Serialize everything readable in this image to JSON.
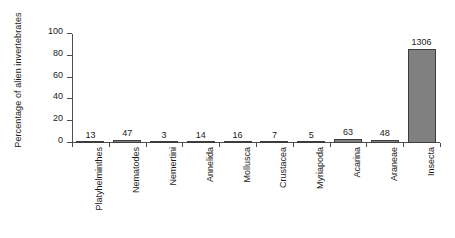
{
  "chart_data": {
    "type": "bar",
    "title": "",
    "xlabel": "",
    "ylabel": "Percentage of alien invertebrates",
    "ylim": [
      0,
      100
    ],
    "yticks": [
      0,
      20,
      40,
      60,
      80,
      100
    ],
    "grid": false,
    "legend": false,
    "categories": [
      "Platyhelminthes",
      "Nematodes",
      "Nemertini",
      "Annelida",
      "Mollusca",
      "Crustacea",
      "Myriapoda",
      "Acarina",
      "Araneae",
      "Insecta"
    ],
    "data_labels": [
      "13",
      "47",
      "3",
      "14",
      "16",
      "7",
      "5",
      "63",
      "48",
      "1306"
    ],
    "counts": [
      13,
      47,
      3,
      14,
      16,
      7,
      5,
      63,
      48,
      1306
    ],
    "values": [
      0.9,
      3.1,
      0.2,
      0.9,
      1.1,
      0.5,
      0.3,
      4.1,
      3.2,
      85.8
    ]
  },
  "style": {
    "bar_fill": "#808080",
    "bar_border": "#3d3d3d",
    "axis_color": "#4d4d4d",
    "text_color": "#1a1a1a",
    "background": "#ffffff"
  }
}
